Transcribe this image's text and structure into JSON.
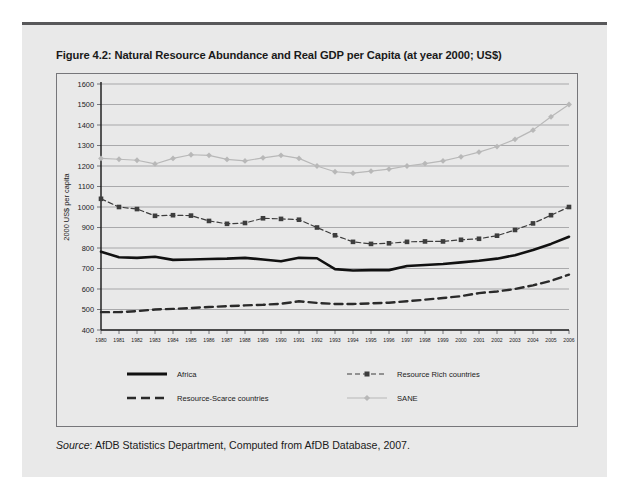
{
  "figure": {
    "title": "Figure 4.2: Natural Resource Abundance and Real GDP per Capita (at year 2000; US$)",
    "source_label": "Source",
    "source_text": ": AfDB Statistics Department, Computed from AfDB Database, 2007."
  },
  "chart_data": {
    "type": "line",
    "title": "Figure 4.2: Natural Resource Abundance and Real GDP per Capita (at year 2000; US$)",
    "xlabel": "",
    "ylabel": "2000 US$ per capita",
    "ylim": [
      400,
      1600
    ],
    "ytick_step": 100,
    "yticks": [
      400,
      500,
      600,
      700,
      800,
      900,
      1000,
      1100,
      1200,
      1300,
      1400,
      1500,
      1600
    ],
    "grid": true,
    "legend_position": "below-plot",
    "categories": [
      "1980",
      "1981",
      "1982",
      "1983",
      "1984",
      "1985",
      "1986",
      "1987",
      "1988",
      "1989",
      "1990",
      "1991",
      "1992",
      "1993",
      "1994",
      "1995",
      "1996",
      "1997",
      "1998",
      "1999",
      "2000",
      "2001",
      "2002",
      "2003",
      "2004",
      "2005",
      "2006"
    ],
    "series": [
      {
        "name": "Africa",
        "color": "#111111",
        "style": "solid",
        "width": 2.6,
        "marker": "none",
        "values": [
          782,
          755,
          752,
          757,
          742,
          744,
          746,
          748,
          752,
          744,
          735,
          752,
          750,
          697,
          690,
          692,
          692,
          712,
          717,
          722,
          730,
          738,
          748,
          765,
          790,
          820,
          855
        ]
      },
      {
        "name": "Resource-Scarce countries",
        "color": "#2a2a2a",
        "style": "dashed",
        "width": 2.4,
        "marker": "none",
        "values": [
          487,
          487,
          492,
          500,
          503,
          507,
          512,
          516,
          520,
          523,
          528,
          540,
          532,
          527,
          527,
          530,
          533,
          540,
          548,
          556,
          565,
          580,
          588,
          600,
          618,
          640,
          670
        ]
      },
      {
        "name": "Resource Rich countries",
        "color": "#3d3d3d",
        "style": "dashed",
        "width": 1.2,
        "marker": "square",
        "values": [
          1040,
          1000,
          990,
          957,
          960,
          958,
          932,
          918,
          922,
          945,
          942,
          938,
          900,
          862,
          830,
          820,
          823,
          830,
          832,
          832,
          840,
          845,
          860,
          888,
          920,
          960,
          1000
        ]
      },
      {
        "name": "SANE",
        "color": "#b8b8b8",
        "style": "solid",
        "width": 1.2,
        "marker": "diamond",
        "values": [
          1237,
          1233,
          1228,
          1210,
          1237,
          1255,
          1252,
          1232,
          1225,
          1240,
          1252,
          1237,
          1200,
          1172,
          1165,
          1175,
          1185,
          1200,
          1212,
          1225,
          1245,
          1268,
          1295,
          1330,
          1375,
          1440,
          1500
        ]
      }
    ],
    "legend": [
      {
        "label": "Africa",
        "swatch": "thick-solid-black"
      },
      {
        "label": "Resource Rich countries",
        "swatch": "dashed-square-marker"
      },
      {
        "label": "Resource-Scarce countries",
        "swatch": "dashed-black"
      },
      {
        "label": "SANE",
        "swatch": "gray-diamond-marker"
      }
    ]
  }
}
